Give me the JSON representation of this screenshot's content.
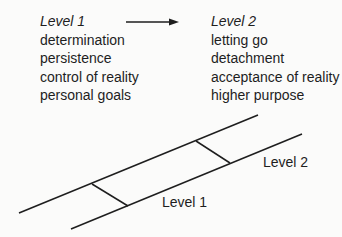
{
  "level1": {
    "title": "Level 1",
    "items": [
      "determination",
      "persistence",
      "control of reality",
      "personal goals"
    ]
  },
  "level2": {
    "title": "Level 2",
    "items": [
      "letting go",
      "detachment",
      "acceptance of reality",
      "higher purpose"
    ]
  },
  "arrow": {
    "from": "Level 1",
    "to": "Level 2"
  },
  "diagram": {
    "labels": {
      "lower": "Level 1",
      "upper": "Level 2"
    },
    "line_color": "#1e1e1e"
  }
}
